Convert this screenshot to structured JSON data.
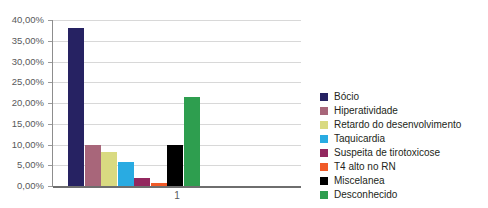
{
  "chart_data": {
    "type": "bar",
    "title": "",
    "subtitle": "",
    "xlabel": "1",
    "ylabel": "",
    "categories": [
      "Bócio",
      "Hiperatividade",
      "Retardo do desenvolvimento",
      "Taquicardia",
      "Suspeita de tirotoxicose",
      "T4 alto no RN",
      "Miscelanea",
      "Desconhecido"
    ],
    "values": [
      38.0,
      10.0,
      8.3,
      5.8,
      2.0,
      0.7,
      10.0,
      21.5
    ],
    "value_labels": [
      "38,00%",
      "10,00%",
      "8,30%",
      "5,80%",
      "2,00%",
      "0,70%",
      "10,00%",
      "21,50%"
    ],
    "colors": [
      "#262262",
      "#a8667a",
      "#d9da81",
      "#29abe2",
      "#93285f",
      "#f05a28",
      "#000000",
      "#2e9e4f"
    ],
    "ylim": [
      0,
      40
    ],
    "ytick_labels": [
      "40,00%",
      "35,00%",
      "30,00%",
      "25,00%",
      "20,00%",
      "15,00%",
      "10,00%",
      "5,00%",
      "0,00%"
    ],
    "ytick_values": [
      40,
      35,
      30,
      25,
      20,
      15,
      10,
      5,
      0
    ],
    "grid": true,
    "legend_position": "right",
    "legend": [
      {
        "label": "Bócio",
        "color": "#262262"
      },
      {
        "label": "Hiperatividade",
        "color": "#a8667a"
      },
      {
        "label": "Retardo do desenvolvimento",
        "color": "#d9da81"
      },
      {
        "label": "Taquicardia",
        "color": "#29abe2"
      },
      {
        "label": "Suspeita de tirotoxicose",
        "color": "#93285f"
      },
      {
        "label": "T4 alto no RN",
        "color": "#f05a28"
      },
      {
        "label": "Miscelanea",
        "color": "#000000"
      },
      {
        "label": "Desconhecido",
        "color": "#2e9e4f"
      }
    ]
  },
  "axes": {
    "x_category_label": "1"
  }
}
